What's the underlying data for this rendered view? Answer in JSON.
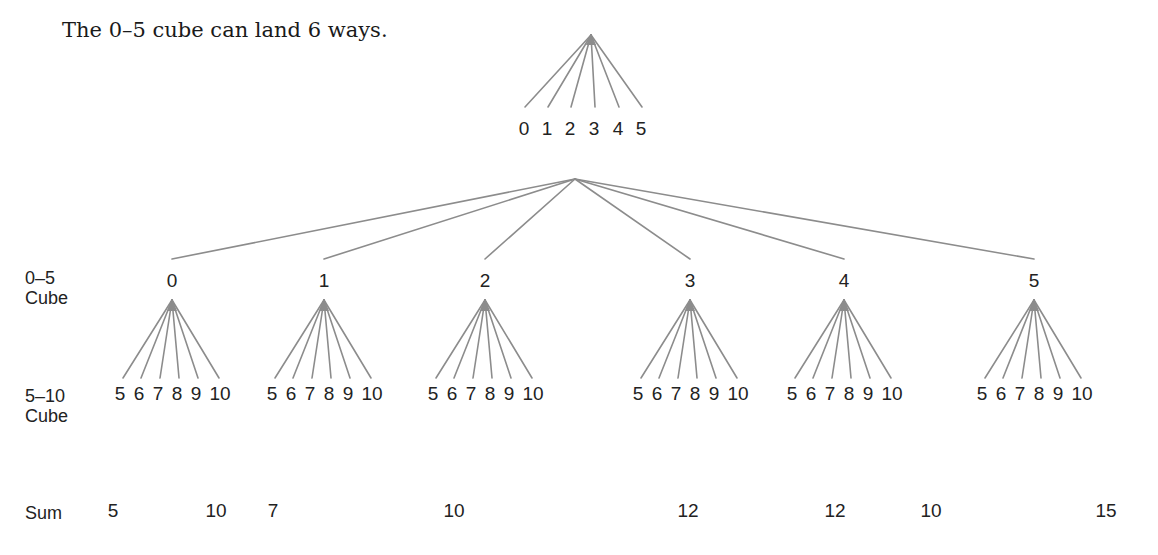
{
  "caption": "The 0–5 cube can land 6 ways.",
  "line_color": "#8c8c8c",
  "top_tree": {
    "apex": [
      591,
      35
    ],
    "leaves": [
      {
        "label": "0",
        "x": 524
      },
      {
        "label": "1",
        "x": 547
      },
      {
        "label": "2",
        "x": 570
      },
      {
        "label": "3",
        "x": 594
      },
      {
        "label": "4",
        "x": 618
      },
      {
        "label": "5",
        "x": 641
      }
    ]
  },
  "row_labels": {
    "first_cube_line1": "0–5",
    "first_cube_line2": "Cube",
    "second_cube_line1": "5–10",
    "second_cube_line2": "Cube",
    "sum": "Sum"
  },
  "branches": [
    {
      "label": "0",
      "x": 172,
      "leaves": [
        "5",
        "6",
        "7",
        "8",
        "9",
        "10"
      ]
    },
    {
      "label": "1",
      "x": 324,
      "leaves": [
        "5",
        "6",
        "7",
        "8",
        "9",
        "10"
      ]
    },
    {
      "label": "2",
      "x": 485,
      "leaves": [
        "5",
        "6",
        "7",
        "8",
        "9",
        "10"
      ]
    },
    {
      "label": "3",
      "x": 690,
      "leaves": [
        "5",
        "6",
        "7",
        "8",
        "9",
        "10"
      ]
    },
    {
      "label": "4",
      "x": 844,
      "leaves": [
        "5",
        "6",
        "7",
        "8",
        "9",
        "10"
      ]
    },
    {
      "label": "5",
      "x": 1034,
      "leaves": [
        "5",
        "6",
        "7",
        "8",
        "9",
        "10"
      ]
    }
  ],
  "sums": [
    {
      "value": "5",
      "x": 113
    },
    {
      "value": "10",
      "x": 216
    },
    {
      "value": "7",
      "x": 273
    },
    {
      "value": "10",
      "x": 454
    },
    {
      "value": "12",
      "x": 688
    },
    {
      "value": "12",
      "x": 835
    },
    {
      "value": "10",
      "x": 931
    },
    {
      "value": "15",
      "x": 1106
    }
  ]
}
